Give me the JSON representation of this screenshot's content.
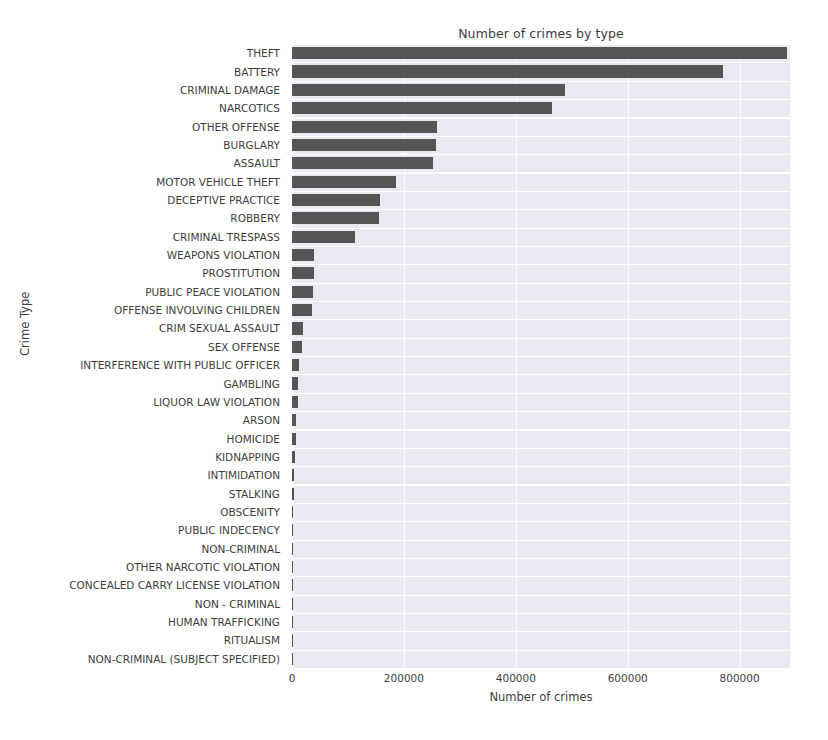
{
  "chart_data": {
    "type": "bar",
    "orientation": "horizontal",
    "title": "Number of crimes by type",
    "xlabel": "Number of crimes",
    "ylabel": "Crime Type",
    "xlim": [
      0,
      890000
    ],
    "xticks": [
      0,
      200000,
      400000,
      600000,
      800000
    ],
    "xticklabels": [
      "0",
      "200000",
      "400000",
      "600000",
      "800000"
    ],
    "grid": true,
    "legend": null,
    "bar_color": "#555555",
    "axes_facecolor": "#eaeaf2",
    "gridline_color": "#ffffff",
    "categories": [
      "THEFT",
      "BATTERY",
      "CRIMINAL DAMAGE",
      "NARCOTICS",
      "OTHER OFFENSE",
      "BURGLARY",
      "ASSAULT",
      "MOTOR VEHICLE THEFT",
      "DECEPTIVE PRACTICE",
      "ROBBERY",
      "CRIMINAL TRESPASS",
      "WEAPONS VIOLATION",
      "PROSTITUTION",
      "PUBLIC PEACE VIOLATION",
      "OFFENSE INVOLVING CHILDREN",
      "CRIM SEXUAL ASSAULT",
      "SEX OFFENSE",
      "INTERFERENCE WITH PUBLIC OFFICER",
      "GAMBLING",
      "LIQUOR LAW VIOLATION",
      "ARSON",
      "HOMICIDE",
      "KIDNAPPING",
      "INTIMIDATION",
      "STALKING",
      "OBSCENITY",
      "PUBLIC INDECENCY",
      "NON-CRIMINAL",
      "OTHER NARCOTIC VIOLATION",
      "CONCEALED CARRY LICENSE VIOLATION",
      "NON - CRIMINAL",
      "HUMAN TRAFFICKING",
      "RITUALISM",
      "NON-CRIMINAL (SUBJECT SPECIFIED)"
    ],
    "values": [
      885000,
      770000,
      487000,
      465000,
      260000,
      258000,
      252000,
      185000,
      158000,
      155000,
      113000,
      40000,
      39000,
      38000,
      36000,
      20000,
      18000,
      12000,
      11000,
      10000,
      7000,
      6500,
      4500,
      3500,
      2800,
      800,
      700,
      600,
      500,
      400,
      250,
      150,
      100,
      50
    ]
  }
}
